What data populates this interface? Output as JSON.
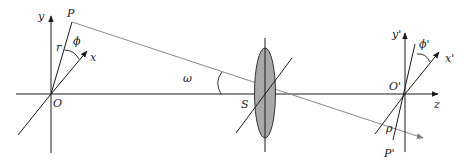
{
  "diagram": {
    "type": "optical-imaging-geometry",
    "labels": {
      "origin_object": "O",
      "axis_y": "y",
      "axis_x": "x",
      "point_object": "P",
      "radius": "r",
      "angle_phi": "ϕ",
      "field_angle": "ω",
      "stop_center": "S",
      "origin_image": "O'",
      "axis_y_image": "y'",
      "axis_x_image": "x'",
      "angle_phi_image": "ϕ'",
      "axis_z": "z",
      "image_radius": "ρ",
      "point_image": "P'"
    },
    "colors": {
      "axes": "#1a1a1a",
      "ray": "#8a8a8a",
      "lens_fill": "#a9a9a9",
      "lens_stroke": "#333333"
    }
  }
}
